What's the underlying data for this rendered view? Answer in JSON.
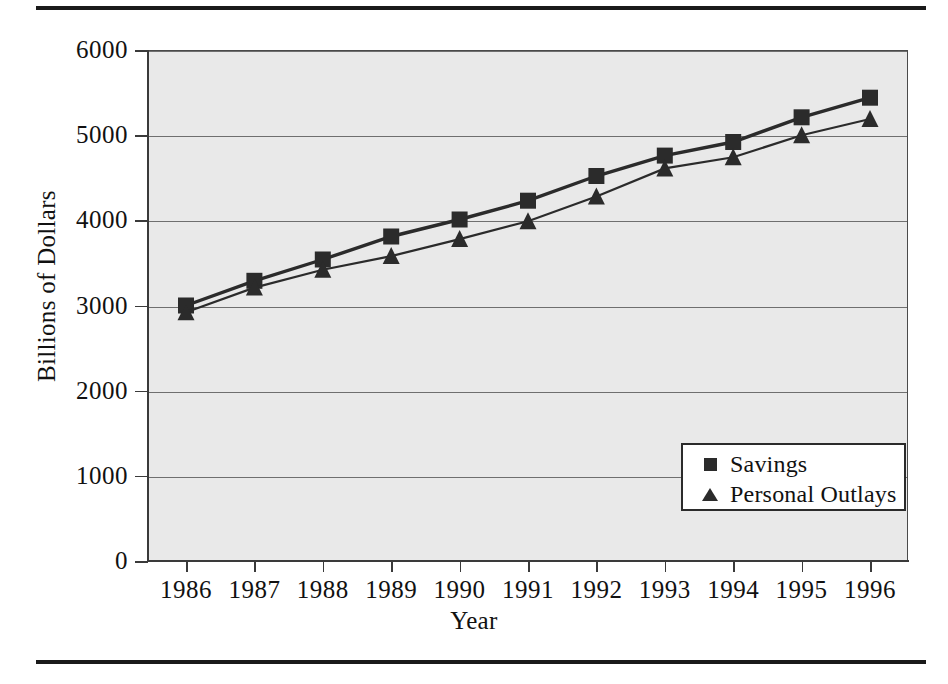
{
  "figure": {
    "top_rule": "horizontal-rule",
    "bottom_rule": "horizontal-rule"
  },
  "chart_data": {
    "type": "line",
    "title": "",
    "xlabel": "Year",
    "ylabel": "Billions of Dollars",
    "categories": [
      "1986",
      "1987",
      "1988",
      "1989",
      "1990",
      "1991",
      "1992",
      "1993",
      "1994",
      "1995",
      "1996"
    ],
    "series": [
      {
        "name": "Savings",
        "marker": "square",
        "color": "#2b2b2b",
        "values": [
          3000,
          3290,
          3540,
          3810,
          4010,
          4230,
          4520,
          4760,
          4920,
          5210,
          5440
        ]
      },
      {
        "name": "Personal Outlays",
        "marker": "triangle",
        "color": "#2b2b2b",
        "values": [
          2920,
          3210,
          3420,
          3580,
          3780,
          3990,
          4280,
          4610,
          4740,
          5000,
          5190
        ]
      }
    ],
    "ylim": [
      0,
      6000
    ],
    "yticks": [
      0,
      1000,
      2000,
      3000,
      4000,
      5000,
      6000
    ],
    "ytick_labels": [
      "0",
      "1000",
      "2000",
      "3000",
      "4000",
      "5000",
      "6000"
    ],
    "grid": true,
    "grid_axis": "y",
    "legend_position": "inside-bottom-right",
    "plot_background": "#e9e9e9"
  }
}
